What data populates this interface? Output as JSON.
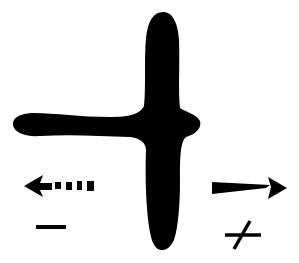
{
  "diagram": {
    "shape": {
      "name": "blob",
      "color": "#000000"
    },
    "left_indicator": {
      "arrow_style": "dashed",
      "direction": "left",
      "sign": "−"
    },
    "right_indicator": {
      "arrow_style": "solid",
      "direction": "right",
      "sign": "+"
    },
    "colors": {
      "background": "#ffffff",
      "ink": "#000000"
    }
  }
}
